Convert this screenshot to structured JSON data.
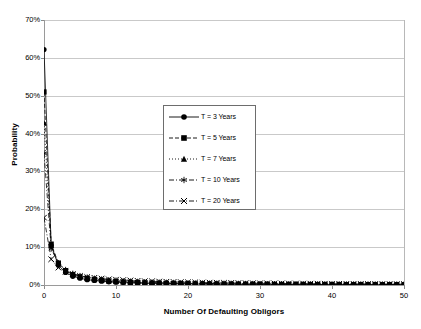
{
  "chart_data": {
    "type": "line",
    "title": "",
    "xlabel": "Number Of Defaulting Obligors",
    "ylabel": "Probability",
    "xlim": [
      0,
      50
    ],
    "ylim": [
      0,
      0.7
    ],
    "grid": true,
    "legend_position": "center",
    "x_ticks": [
      "0",
      "10",
      "20",
      "30",
      "40",
      "50"
    ],
    "x_tick_values": [
      0,
      10,
      20,
      30,
      40,
      50
    ],
    "y_ticks": [
      "0%",
      "10%",
      "20%",
      "30%",
      "40%",
      "50%",
      "60%",
      "70%"
    ],
    "y_tick_values": [
      0,
      0.1,
      0.2,
      0.3,
      0.4,
      0.5,
      0.6,
      0.7
    ],
    "x": [
      0,
      1,
      2,
      3,
      4,
      5,
      6,
      7,
      8,
      9,
      10,
      11,
      12,
      13,
      14,
      15,
      16,
      17,
      18,
      19,
      20,
      21,
      22,
      23,
      24,
      25,
      26,
      27,
      28,
      29,
      30,
      31,
      32,
      33,
      34,
      35,
      36,
      37,
      38,
      39,
      40,
      41,
      42,
      43,
      44,
      45,
      46,
      47,
      48,
      49,
      50
    ],
    "series": [
      {
        "name": "T = 3 Years",
        "marker": "circle",
        "linestyle": "solid",
        "color": "#000000",
        "values": [
          0.622,
          0.104,
          0.052,
          0.033,
          0.023,
          0.018,
          0.014,
          0.012,
          0.01,
          0.0085,
          0.0074,
          0.0065,
          0.0057,
          0.0051,
          0.0046,
          0.0041,
          0.0037,
          0.0034,
          0.0031,
          0.0029,
          0.0027,
          0.0025,
          0.0023,
          0.0021,
          0.002,
          0.0019,
          0.0018,
          0.0017,
          0.0016,
          0.0015,
          0.0014,
          0.0014,
          0.0013,
          0.0012,
          0.0012,
          0.0011,
          0.0011,
          0.001,
          0.001,
          0.0009,
          0.0009,
          0.0009,
          0.0008,
          0.0008,
          0.0008,
          0.0007,
          0.0007,
          0.0007,
          0.0007,
          0.0006,
          0.0006
        ]
      },
      {
        "name": "T = 5 Years",
        "marker": "square",
        "linestyle": "dashed",
        "color": "#000000",
        "values": [
          0.51,
          0.108,
          0.058,
          0.038,
          0.027,
          0.021,
          0.017,
          0.014,
          0.012,
          0.01,
          0.009,
          0.0079,
          0.007,
          0.0063,
          0.0057,
          0.0051,
          0.0047,
          0.0043,
          0.0039,
          0.0036,
          0.0034,
          0.0031,
          0.0029,
          0.0027,
          0.0026,
          0.0024,
          0.0023,
          0.0022,
          0.0021,
          0.0019,
          0.0019,
          0.0018,
          0.0017,
          0.0016,
          0.0015,
          0.0015,
          0.0014,
          0.0014,
          0.0013,
          0.0013,
          0.0012,
          0.0012,
          0.0011,
          0.0011,
          0.001,
          0.001,
          0.001,
          0.0009,
          0.0009,
          0.0009,
          0.0008
        ]
      },
      {
        "name": "T = 7 Years",
        "marker": "triangle",
        "linestyle": "dotted",
        "color": "#000000",
        "values": [
          0.428,
          0.104,
          0.058,
          0.039,
          0.029,
          0.023,
          0.019,
          0.016,
          0.013,
          0.012,
          0.01,
          0.0091,
          0.0082,
          0.0074,
          0.0067,
          0.0061,
          0.0056,
          0.0051,
          0.0047,
          0.0044,
          0.0041,
          0.0038,
          0.0035,
          0.0033,
          0.0031,
          0.0029,
          0.0028,
          0.0026,
          0.0025,
          0.0024,
          0.0022,
          0.0021,
          0.002,
          0.0019,
          0.0019,
          0.0018,
          0.0017,
          0.0016,
          0.0016,
          0.0015,
          0.0015,
          0.0014,
          0.0014,
          0.0013,
          0.0013,
          0.0012,
          0.0012,
          0.0011,
          0.0011,
          0.0011,
          0.001
        ]
      },
      {
        "name": "T = 10 Years",
        "marker": "asterisk",
        "linestyle": "dashdot",
        "color": "#000000",
        "values": [
          0.348,
          0.096,
          0.057,
          0.04,
          0.03,
          0.024,
          0.02,
          0.017,
          0.015,
          0.013,
          0.012,
          0.01,
          0.0094,
          0.0086,
          0.0079,
          0.0072,
          0.0067,
          0.0062,
          0.0057,
          0.0053,
          0.005,
          0.0047,
          0.0044,
          0.0041,
          0.0039,
          0.0037,
          0.0035,
          0.0033,
          0.0031,
          0.003,
          0.0028,
          0.0027,
          0.0026,
          0.0025,
          0.0024,
          0.0023,
          0.0022,
          0.0021,
          0.002,
          0.0019,
          0.0019,
          0.0018,
          0.0017,
          0.0017,
          0.0016,
          0.0016,
          0.0015,
          0.0015,
          0.0014,
          0.0014,
          0.0013
        ]
      },
      {
        "name": "T = 20 Years",
        "marker": "x",
        "linestyle": "dashdot",
        "color": "#000000",
        "values": [
          0.178,
          0.068,
          0.046,
          0.035,
          0.029,
          0.024,
          0.021,
          0.019,
          0.017,
          0.015,
          0.014,
          0.013,
          0.012,
          0.011,
          0.01,
          0.0096,
          0.009,
          0.0085,
          0.008,
          0.0076,
          0.0072,
          0.0068,
          0.0065,
          0.0062,
          0.0059,
          0.0056,
          0.0054,
          0.0051,
          0.0049,
          0.0047,
          0.0045,
          0.0044,
          0.0042,
          0.004,
          0.0039,
          0.0038,
          0.0036,
          0.0035,
          0.0034,
          0.0033,
          0.0032,
          0.0031,
          0.003,
          0.0029,
          0.0028,
          0.0027,
          0.0027,
          0.0026,
          0.0025,
          0.0024,
          0.0024
        ]
      }
    ]
  }
}
